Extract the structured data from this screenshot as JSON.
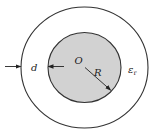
{
  "diagram": {
    "labels": {
      "center": "O",
      "radius": "R",
      "thickness": "d",
      "permittivity_symbol": "ε",
      "permittivity_subscript": "r"
    },
    "colors": {
      "inner_fill": "#d2d2d2",
      "stroke": "#333333",
      "background": "#ffffff"
    }
  }
}
